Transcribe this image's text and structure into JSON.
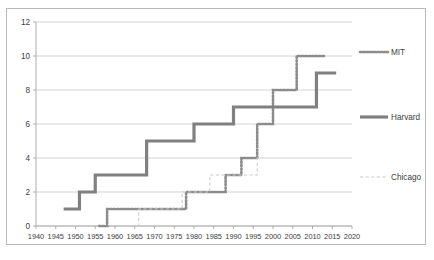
{
  "chart_data": {
    "type": "line",
    "title": "",
    "subtitle": "",
    "xlabel": "",
    "ylabel": "",
    "xlim": [
      1940,
      2020
    ],
    "ylim": [
      0,
      12
    ],
    "ytick_step": 2,
    "xtick_step": 5,
    "grid": "horizontal",
    "legend_position": "right",
    "xticks": [
      1940,
      1945,
      1950,
      1955,
      1960,
      1965,
      1970,
      1975,
      1980,
      1985,
      1990,
      1995,
      2000,
      2005,
      2010,
      2015,
      2020
    ],
    "yticks": [
      0,
      2,
      4,
      6,
      8,
      10,
      12
    ],
    "series": [
      {
        "name": "MIT",
        "color": "#8c8c8c",
        "style": "dotted",
        "width": 2.6,
        "x": [
          1956,
          1958,
          1958,
          1978,
          1978,
          1982,
          1982,
          1988,
          1988,
          1992,
          1992,
          1996,
          1996,
          2000,
          2000,
          2006,
          2006,
          2013
        ],
        "y": [
          0,
          0,
          1,
          1,
          2,
          2,
          2,
          2,
          3,
          3,
          4,
          4,
          6,
          6,
          8,
          8,
          10,
          10
        ]
      },
      {
        "name": "Harvard",
        "color": "#808080",
        "style": "solid",
        "width": 3.2,
        "x": [
          1947,
          1951,
          1951,
          1955,
          1955,
          1960,
          1960,
          1968,
          1968,
          1973,
          1973,
          1980,
          1980,
          1990,
          1990,
          2011,
          2011,
          2016
        ],
        "y": [
          1,
          1,
          2,
          2,
          3,
          3,
          3,
          3,
          5,
          5,
          5,
          5,
          6,
          6,
          7,
          7,
          9,
          9
        ]
      },
      {
        "name": "Chicago",
        "color": "#cccccc",
        "style": "dashed",
        "width": 1.1,
        "x": [
          1963,
          1966,
          1966,
          1977,
          1977,
          1980,
          1980,
          1984,
          1984,
          1993,
          1993,
          1996,
          1996,
          1997
        ],
        "y": [
          0,
          0,
          1,
          1,
          2,
          2,
          2,
          2,
          3,
          3,
          3,
          3,
          4,
          4
        ]
      }
    ]
  },
  "legend": {
    "items": [
      {
        "label": "MIT",
        "key": 0
      },
      {
        "label": "Harvard",
        "key": 1
      },
      {
        "label": "Chicago",
        "key": 2
      }
    ]
  }
}
